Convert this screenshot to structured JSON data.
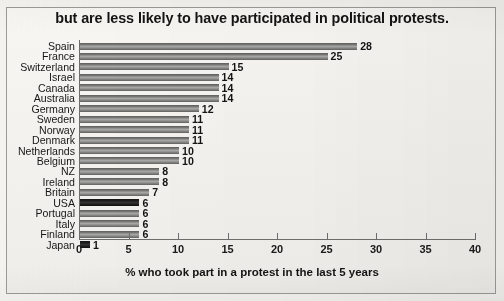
{
  "chart_data": {
    "type": "bar",
    "orientation": "horizontal",
    "title": "but are less likely to have participated in political protests.",
    "xlabel": "% who took part in a protest in the last 5 years",
    "ylabel": "",
    "xlim": [
      0,
      40
    ],
    "xticks": [
      0,
      5,
      10,
      15,
      20,
      25,
      30,
      35,
      40
    ],
    "grid": false,
    "legend": null,
    "categories": [
      "Spain",
      "France",
      "Switzerland",
      "Israel",
      "Canada",
      "Australia",
      "Germany",
      "Sweden",
      "Norway",
      "Denmark",
      "Netherlands",
      "Belgium",
      "NZ",
      "Ireland",
      "Britain",
      "USA",
      "Portugal",
      "Italy",
      "Finland",
      "Japan"
    ],
    "values": [
      28,
      25,
      15,
      14,
      14,
      14,
      12,
      11,
      11,
      11,
      10,
      10,
      8,
      8,
      7,
      6,
      6,
      6,
      6,
      1
    ],
    "bars": [
      {
        "category": "Spain",
        "value": 28,
        "label": "28",
        "highlight": false
      },
      {
        "category": "France",
        "value": 25,
        "label": "25",
        "highlight": false
      },
      {
        "category": "Switzerland",
        "value": 15,
        "label": "15",
        "highlight": false
      },
      {
        "category": "Israel",
        "value": 14,
        "label": "14",
        "highlight": false
      },
      {
        "category": "Canada",
        "value": 14,
        "label": "14",
        "highlight": false
      },
      {
        "category": "Australia",
        "value": 14,
        "label": "14",
        "highlight": false
      },
      {
        "category": "Germany",
        "value": 12,
        "label": "12",
        "highlight": false
      },
      {
        "category": "Sweden",
        "value": 11,
        "label": "11",
        "highlight": false
      },
      {
        "category": "Norway",
        "value": 11,
        "label": "11",
        "highlight": false
      },
      {
        "category": "Denmark",
        "value": 11,
        "label": "11",
        "highlight": false
      },
      {
        "category": "Netherlands",
        "value": 10,
        "label": "10",
        "highlight": false
      },
      {
        "category": "Belgium",
        "value": 10,
        "label": "10",
        "highlight": false
      },
      {
        "category": "NZ",
        "value": 8,
        "label": "8",
        "highlight": false
      },
      {
        "category": "Ireland",
        "value": 8,
        "label": "8",
        "highlight": false
      },
      {
        "category": "Britain",
        "value": 7,
        "label": "7",
        "highlight": false
      },
      {
        "category": "USA",
        "value": 6,
        "label": "6",
        "highlight": true
      },
      {
        "category": "Portugal",
        "value": 6,
        "label": "6",
        "highlight": false
      },
      {
        "category": "Italy",
        "value": 6,
        "label": "6",
        "highlight": false
      },
      {
        "category": "Finland",
        "value": 6,
        "label": "6",
        "highlight": false
      },
      {
        "category": "Japan",
        "value": 1,
        "label": "1",
        "highlight": true
      }
    ],
    "colors": {
      "bar": "#8e8e8c",
      "bar_highlight": "#1d1d1d",
      "axis": "#6d6d6b",
      "text": "#141414",
      "background": "#f2f1ed",
      "frame": "#9a9a98"
    }
  }
}
